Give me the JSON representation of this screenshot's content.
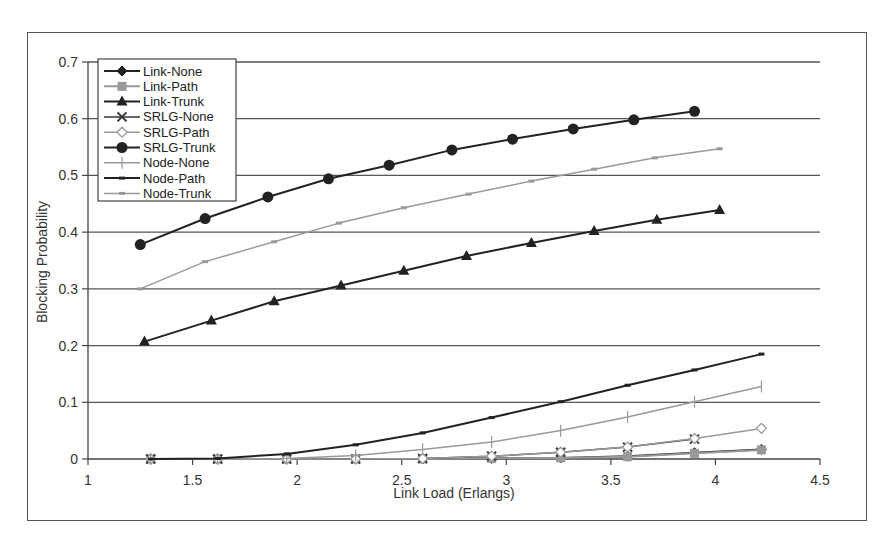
{
  "chart_data": {
    "type": "line",
    "title": "",
    "xlabel": "Link Load (Erlangs)",
    "ylabel": "Blocking Probability",
    "xlim": [
      1,
      4.5
    ],
    "ylim": [
      0,
      0.7
    ],
    "xticks": [
      "1",
      "1.5",
      "2",
      "2.5",
      "3",
      "3.5",
      "4",
      "4.5"
    ],
    "yticks": [
      "0",
      "0.1",
      "0.2",
      "0.3",
      "0.4",
      "0.5",
      "0.6",
      "0.7"
    ],
    "grid": "horizontal",
    "legend_position": "upper-left-inside",
    "series": [
      {
        "name": "Link-None",
        "color": "#222222",
        "width": 2,
        "marker": "diamond",
        "x": [
          1.3,
          1.62,
          1.95,
          2.28,
          2.6,
          2.93,
          3.26,
          3.58,
          3.9,
          4.22
        ],
        "y": [
          0,
          0,
          0,
          0,
          0,
          0.001,
          0.002,
          0.005,
          0.011,
          0.017
        ]
      },
      {
        "name": "Link-Path",
        "color": "#999999",
        "width": 2,
        "marker": "square",
        "x": [
          1.3,
          1.62,
          1.95,
          2.28,
          2.6,
          2.93,
          3.26,
          3.58,
          3.9,
          4.22
        ],
        "y": [
          0,
          0,
          0,
          0,
          0,
          0.001,
          0.002,
          0.004,
          0.01,
          0.016
        ]
      },
      {
        "name": "Link-Trunk",
        "color": "#222222",
        "width": 2,
        "marker": "triangle",
        "x": [
          1.27,
          1.59,
          1.89,
          2.21,
          2.51,
          2.81,
          3.12,
          3.42,
          3.72,
          4.02
        ],
        "y": [
          0.207,
          0.244,
          0.278,
          0.306,
          0.332,
          0.358,
          0.381,
          0.402,
          0.422,
          0.439
        ]
      },
      {
        "name": "SRLG-None",
        "color": "#333333",
        "width": 1.5,
        "marker": "x",
        "x": [
          1.3,
          1.62,
          1.95,
          2.28,
          2.6,
          2.93,
          3.26,
          3.58,
          3.9
        ],
        "y": [
          0,
          0,
          0,
          0,
          0.001,
          0.005,
          0.012,
          0.021,
          0.035
        ]
      },
      {
        "name": "SRLG-Path",
        "color": "#999999",
        "width": 1.5,
        "marker": "diamond-open",
        "x": [
          1.3,
          1.62,
          1.95,
          2.28,
          2.6,
          2.93,
          3.26,
          3.58,
          3.9,
          4.22
        ],
        "y": [
          0,
          0,
          0,
          0,
          0.001,
          0.005,
          0.012,
          0.021,
          0.036,
          0.054
        ]
      },
      {
        "name": "SRLG-Trunk",
        "color": "#222222",
        "width": 2,
        "marker": "circle",
        "x": [
          1.25,
          1.56,
          1.86,
          2.15,
          2.44,
          2.74,
          3.03,
          3.32,
          3.61,
          3.9
        ],
        "y": [
          0.378,
          0.424,
          0.462,
          0.494,
          0.518,
          0.545,
          0.564,
          0.582,
          0.598,
          0.613
        ]
      },
      {
        "name": "Node-None",
        "color": "#999999",
        "width": 1.5,
        "marker": "plus",
        "x": [
          1.3,
          1.62,
          1.95,
          2.28,
          2.6,
          2.93,
          3.26,
          3.58,
          3.9,
          4.22
        ],
        "y": [
          0,
          0,
          0.001,
          0.006,
          0.017,
          0.03,
          0.05,
          0.074,
          0.101,
          0.128
        ]
      },
      {
        "name": "Node-Path",
        "color": "#222222",
        "width": 2,
        "marker": "dash",
        "x": [
          1.3,
          1.62,
          1.95,
          2.28,
          2.6,
          2.93,
          3.26,
          3.58,
          3.9,
          4.22
        ],
        "y": [
          0,
          0.001,
          0.009,
          0.025,
          0.046,
          0.073,
          0.101,
          0.13,
          0.157,
          0.185
        ]
      },
      {
        "name": "Node-Trunk",
        "color": "#999999",
        "width": 1.5,
        "marker": "dash",
        "x": [
          1.25,
          1.56,
          1.89,
          2.2,
          2.51,
          2.82,
          3.12,
          3.42,
          3.71,
          4.02
        ],
        "y": [
          0.3,
          0.348,
          0.383,
          0.416,
          0.443,
          0.467,
          0.49,
          0.511,
          0.531,
          0.547
        ]
      }
    ]
  }
}
